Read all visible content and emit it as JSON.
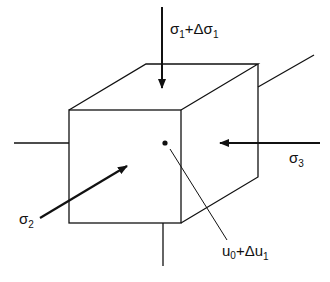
{
  "diagram": {
    "type": "stress-cube",
    "labels": {
      "sigma1": {
        "base": "σ",
        "sub": "1",
        "rest": "+Δσ",
        "sub2": "1"
      },
      "sigma2": {
        "base": "σ",
        "sub": "2"
      },
      "sigma3": {
        "base": "σ",
        "sub": "3"
      },
      "pore": {
        "base": "u",
        "sub": "0",
        "rest": "+Δu",
        "sub2": "1"
      }
    },
    "arrows": [
      "sigma1 downward onto top face",
      "sigma2 into front face",
      "sigma3 into right face"
    ],
    "point": "center of cube (pore pressure)"
  }
}
